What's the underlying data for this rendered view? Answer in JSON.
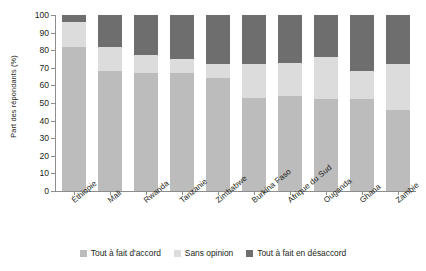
{
  "chart_data": {
    "type": "bar",
    "stacked": true,
    "stack_total": 100,
    "title": "",
    "subtitle": "",
    "xlabel": "",
    "ylabel": "Part des répondants (%)",
    "ylim": [
      0,
      100
    ],
    "yticks": [
      0,
      10,
      20,
      30,
      40,
      50,
      60,
      70,
      80,
      90,
      100
    ],
    "ytick_labels": [
      "0",
      "10",
      "20",
      "30",
      "40",
      "50",
      "60",
      "70",
      "80",
      "90",
      "100"
    ],
    "grid": false,
    "legend_position": "bottom",
    "categories": [
      "Éthiopie",
      "Mali",
      "Rwanda",
      "Tanzanie",
      "Zimbabwe",
      "Burkina Faso",
      "Afrique du Sud",
      "Ouganda",
      "Ghana",
      "Zambie"
    ],
    "series": [
      {
        "name": "Tout à fait d'accord",
        "color": "#bcbcbc",
        "values": [
          82,
          68,
          67,
          67,
          64,
          53,
          54,
          52,
          52,
          46
        ]
      },
      {
        "name": "Sans opinion",
        "color": "#dcdcdc",
        "values": [
          14,
          14,
          10,
          8,
          8,
          19,
          19,
          24,
          16,
          26
        ]
      },
      {
        "name": "Tout à fait en désaccord",
        "color": "#6e6e6e",
        "values": [
          4,
          18,
          23,
          25,
          28,
          28,
          27,
          24,
          32,
          28
        ]
      }
    ]
  },
  "legend": {
    "items": [
      {
        "label": "Tout à fait d'accord",
        "swatch_class": "sw-agree"
      },
      {
        "label": "Sans opinion",
        "swatch_class": "sw-noop"
      },
      {
        "label": "Tout à fait en désaccord",
        "swatch_class": "sw-dis"
      }
    ]
  },
  "colors": {
    "agree": "#bcbcbc",
    "no_opinion": "#dcdcdc",
    "disagree": "#6e6e6e",
    "axis": "#8d8d8d",
    "text": "#231f20",
    "background": "#ffffff"
  }
}
